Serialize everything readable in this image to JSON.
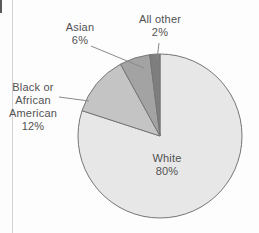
{
  "chart_data": {
    "type": "pie",
    "title": "",
    "unit": "%",
    "direction_from_12_oclock": "counterclockwise",
    "slices": [
      {
        "label": "White",
        "value": 80,
        "color": "#e7e7e7"
      },
      {
        "label": "Black or African American",
        "value": 12,
        "color": "#c4c4c4"
      },
      {
        "label": "Asian",
        "value": 6,
        "color": "#a3a3a3"
      },
      {
        "label": "All other",
        "value": 2,
        "color": "#7e7e7e"
      }
    ],
    "slice_stroke_color": "#767676",
    "leader_line_color": "#8a8a8a",
    "legend_position": "none",
    "labels_outside_with_leader_lines": [
      "Asian",
      "All other",
      "Black or African American"
    ],
    "label_inside": "White"
  },
  "labels": {
    "asian": {
      "name": "Asian",
      "pct": "6%"
    },
    "all_other": {
      "name": "All other",
      "pct": "2%"
    },
    "black": {
      "line1": "Black or",
      "line2": "African",
      "line3": "American",
      "pct": "12%"
    },
    "white": {
      "name": "White",
      "pct": "80%"
    }
  },
  "decorations": {
    "page_rule_color": "#d2d2d2",
    "page_edge_mark_color": "#5a5a5a"
  }
}
